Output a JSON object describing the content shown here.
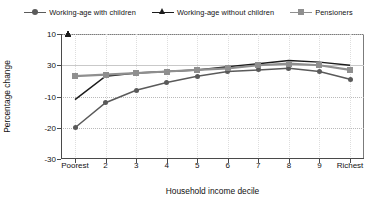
{
  "chart_data": {
    "type": "line",
    "title": "",
    "xlabel": "Household income decile",
    "ylabel": "Percentage change",
    "categories": [
      "Poorest",
      "2",
      "3",
      "4",
      "5",
      "6",
      "7",
      "8",
      "9",
      "Richest"
    ],
    "x_tick_labels": [
      "Poorest",
      "2",
      "3",
      "4",
      "5",
      "6",
      "7",
      "8",
      "9",
      "Richest"
    ],
    "y_tick_labels": [
      "10",
      "30",
      "-10",
      "-20",
      "-30"
    ],
    "y_tick_values": [
      10,
      0,
      -10,
      -20,
      -30
    ],
    "ylim": [
      -30,
      10
    ],
    "grid": "horizontal-dotted",
    "legend_position": "top",
    "series": [
      {
        "name": "Working-age with children",
        "color": "#5a5a5a",
        "marker": "circle",
        "values": [
          -20.0,
          -12.0,
          -8.0,
          -5.5,
          -3.5,
          -2.0,
          -1.5,
          -1.0,
          -2.0,
          -4.5
        ]
      },
      {
        "name": "Working-age without children",
        "color": "#1c1c1c",
        "marker": "triangle",
        "values": [
          -11.0,
          -3.5,
          -2.5,
          -2.0,
          -1.5,
          -0.5,
          0.5,
          1.5,
          1.0,
          0.0
        ]
      },
      {
        "name": "Pensioners",
        "color": "#8f8f8f",
        "marker": "square",
        "values": [
          -3.5,
          -3.0,
          -2.5,
          -2.0,
          -1.5,
          -1.0,
          0.0,
          0.5,
          0.0,
          -1.5
        ]
      }
    ]
  },
  "legend": {
    "entries": [
      {
        "label": "Working-age with children",
        "marker": "circle-marker",
        "color": "#5a5a5a"
      },
      {
        "label": "Working-age without children",
        "marker": "triangle-marker",
        "color": "#1c1c1c"
      },
      {
        "label": "Pensioners",
        "marker": "square-marker",
        "color": "#8f8f8f"
      }
    ]
  },
  "axes": {
    "y_title": "Percentage change",
    "x_title": "Household income decile"
  }
}
